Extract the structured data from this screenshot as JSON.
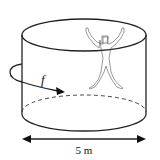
{
  "diagram": {
    "rotation_label": "f",
    "diameter_label": "5 m",
    "elements": [
      "cylinder",
      "person",
      "rotation-arrow",
      "diameter-arrow"
    ]
  }
}
